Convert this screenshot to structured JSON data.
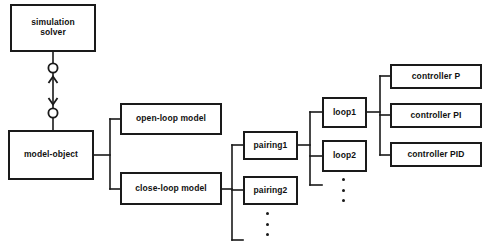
{
  "diagram": {
    "type": "block-hierarchy",
    "background_color": "#ffffff",
    "line_color": "#1a1a1a",
    "text_color": "#111111",
    "nodes": [
      {
        "id": "simulation-solver",
        "label": "simulation\nsolver",
        "x": 10,
        "y": 4,
        "w": 86,
        "h": 48,
        "font_size": 8.5
      },
      {
        "id": "model-object",
        "label": "model-object",
        "x": 8,
        "y": 130,
        "w": 86,
        "h": 50,
        "font_size": 8.5
      },
      {
        "id": "open-loop-model",
        "label": "open-loop model",
        "x": 120,
        "y": 103,
        "w": 102,
        "h": 32,
        "font_size": 8.5
      },
      {
        "id": "close-loop-model",
        "label": "close-loop model",
        "x": 120,
        "y": 172,
        "w": 102,
        "h": 33,
        "font_size": 8.5
      },
      {
        "id": "pairing1",
        "label": "pairing1",
        "x": 243,
        "y": 131,
        "w": 55,
        "h": 29,
        "font_size": 8.5
      },
      {
        "id": "pairing2",
        "label": "pairing2",
        "x": 243,
        "y": 176,
        "w": 55,
        "h": 29,
        "font_size": 8.5
      },
      {
        "id": "loop1",
        "label": "loop1",
        "x": 322,
        "y": 97,
        "w": 45,
        "h": 31,
        "font_size": 8.5
      },
      {
        "id": "loop2",
        "label": "loop2",
        "x": 322,
        "y": 140,
        "w": 45,
        "h": 32,
        "font_size": 8.5
      },
      {
        "id": "controller-p",
        "label": "controller P",
        "x": 390,
        "y": 64,
        "w": 92,
        "h": 25,
        "font_size": 8.5
      },
      {
        "id": "controller-pi",
        "label": "controller PI",
        "x": 390,
        "y": 103,
        "w": 92,
        "h": 25,
        "font_size": 8.5
      },
      {
        "id": "controller-pid",
        "label": "controller PID",
        "x": 390,
        "y": 142,
        "w": 92,
        "h": 25,
        "font_size": 8.5
      }
    ],
    "ellipses": [
      {
        "id": "pairing-ellipsis",
        "x": 266,
        "y": 213,
        "count": 3,
        "spacing": 9
      },
      {
        "id": "loop-ellipsis",
        "x": 342,
        "y": 179,
        "count": 3,
        "spacing": 9
      }
    ],
    "connector_symbols": {
      "association_circle": "open-circle",
      "arrow_up": "arrowhead-up",
      "arrow_down": "arrowhead-down"
    },
    "edges": [
      {
        "id": "solver-to-model-object",
        "from": "simulation-solver",
        "to": "model-object",
        "style": "bidirectional-association"
      },
      {
        "id": "model-object-to-open-loop",
        "from": "model-object",
        "to": "open-loop-model",
        "style": "tree-branch"
      },
      {
        "id": "model-object-to-close-loop",
        "from": "model-object",
        "to": "close-loop-model",
        "style": "tree-branch"
      },
      {
        "id": "close-loop-to-pairing1",
        "from": "close-loop-model",
        "to": "pairing1",
        "style": "tree-branch"
      },
      {
        "id": "close-loop-to-pairing2",
        "from": "close-loop-model",
        "to": "pairing2",
        "style": "tree-branch"
      },
      {
        "id": "pairing1-to-loop1",
        "from": "pairing1",
        "to": "loop1",
        "style": "tree-branch"
      },
      {
        "id": "pairing1-to-loop2",
        "from": "pairing1",
        "to": "loop2",
        "style": "tree-branch"
      },
      {
        "id": "loop1-to-controller-p",
        "from": "loop1",
        "to": "controller-p",
        "style": "tree-branch"
      },
      {
        "id": "loop1-to-controller-pi",
        "from": "loop1",
        "to": "controller-pi",
        "style": "tree-branch"
      },
      {
        "id": "loop1-to-controller-pid",
        "from": "loop1",
        "to": "controller-pid",
        "style": "tree-branch"
      }
    ]
  }
}
